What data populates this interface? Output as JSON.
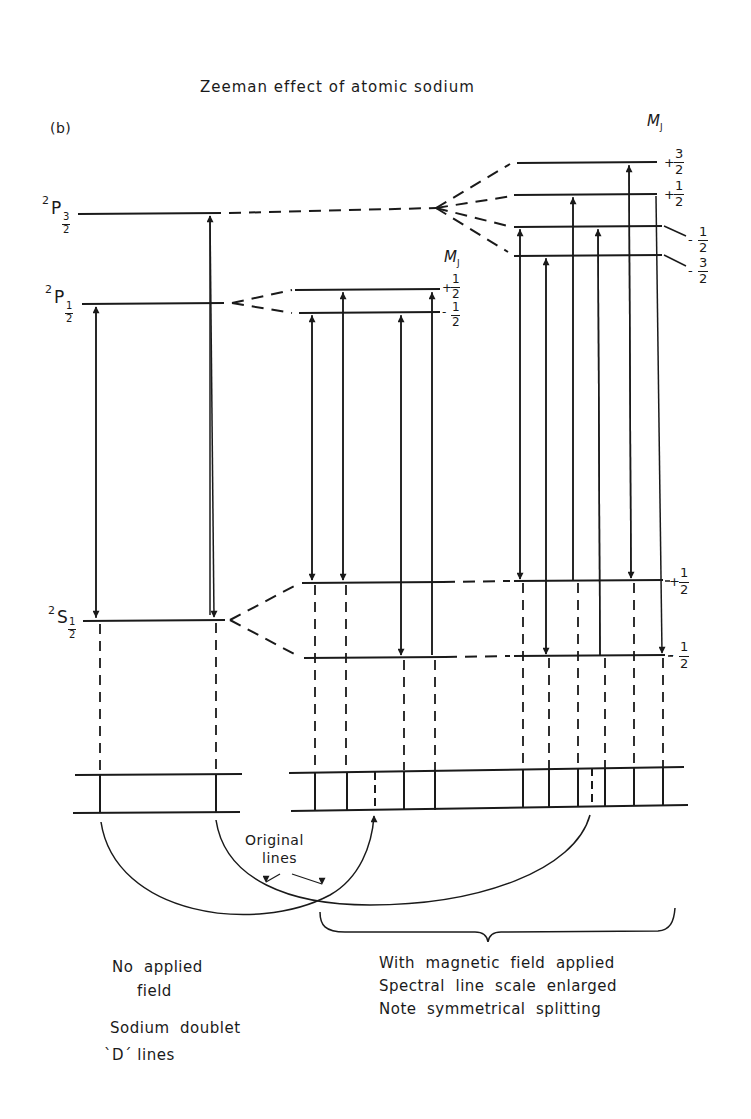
{
  "title": "Zeeman effect of atomic sodium",
  "panel_label": "(b)",
  "levels": {
    "p32": {
      "term": "P",
      "mult": "2",
      "j_num": "3",
      "j_den": "2"
    },
    "p12": {
      "term": "P",
      "mult": "2",
      "j_num": "1",
      "j_den": "2"
    },
    "s12": {
      "term": "S",
      "mult": "2",
      "j_num": "1",
      "j_den": "2"
    }
  },
  "mj_label": "M",
  "mj_sub": "J",
  "mj_values": {
    "p32": [
      "+3/2",
      "+1/2",
      "-1/2",
      "-3/2"
    ],
    "p12": [
      "+1/2",
      "-1/2"
    ],
    "s12": [
      "+1/2",
      "-1/2"
    ]
  },
  "mj_parts": {
    "plus": "+",
    "minus": "-",
    "one": "1",
    "three": "3",
    "two": "2"
  },
  "annotation": {
    "line1": "Original",
    "line2": "lines"
  },
  "captions": {
    "left": {
      "line1": "No  applied",
      "line2": "field",
      "line3": "Sodium  doublet",
      "line4": "`D´ lines"
    },
    "right": {
      "line1": "With  magnetic  field  applied",
      "line2": "Spectral  line  scale  enlarged",
      "line3": "Note  symmetrical  splitting"
    }
  },
  "colors": {
    "ink": "#1a1a1a",
    "background": "#ffffff"
  }
}
